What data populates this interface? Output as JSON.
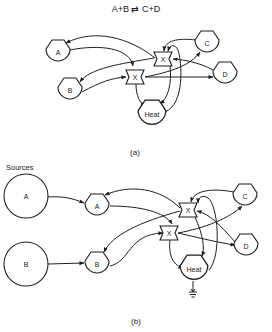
{
  "title": "A+B ⇄ C+D",
  "panels": [
    {
      "id": "a",
      "caption": "(a)",
      "nodes": [
        {
          "id": "a-A",
          "label": "A",
          "shape": "pentagon-bag"
        },
        {
          "id": "a-B",
          "label": "B",
          "shape": "pentagon-bag"
        },
        {
          "id": "a-X1",
          "label": "X",
          "shape": "flag"
        },
        {
          "id": "a-X2",
          "label": "X",
          "shape": "flag"
        },
        {
          "id": "a-C",
          "label": "C",
          "shape": "pentagon-bag"
        },
        {
          "id": "a-D",
          "label": "D",
          "shape": "pentagon-bag"
        },
        {
          "id": "a-Heat",
          "label": "Heat",
          "shape": "pentagon-bag"
        }
      ]
    },
    {
      "id": "b",
      "caption": "(b)",
      "sources_label": "Sources",
      "nodes": [
        {
          "id": "b-srcA",
          "label": "A",
          "shape": "circle"
        },
        {
          "id": "b-srcB",
          "label": "B",
          "shape": "circle"
        },
        {
          "id": "b-A",
          "label": "A",
          "shape": "pentagon-bag"
        },
        {
          "id": "b-B",
          "label": "B",
          "shape": "pentagon-bag"
        },
        {
          "id": "b-X1",
          "label": "X",
          "shape": "flag"
        },
        {
          "id": "b-X2",
          "label": "X",
          "shape": "flag"
        },
        {
          "id": "b-C",
          "label": "C",
          "shape": "pentagon-bag"
        },
        {
          "id": "b-D",
          "label": "D",
          "shape": "pentagon-bag"
        },
        {
          "id": "b-Heat",
          "label": "Heat",
          "shape": "pentagon-bag"
        },
        {
          "id": "b-ground",
          "label": "",
          "shape": "ground-symbol"
        }
      ]
    }
  ],
  "labels": {
    "a_A": "A",
    "a_B": "B",
    "a_X1": "X",
    "a_X2": "X",
    "a_C": "C",
    "a_D": "D",
    "a_Heat": "Heat",
    "b_srcA": "A",
    "b_srcB": "B",
    "b_A": "A",
    "b_B": "B",
    "b_X1": "X",
    "b_X2": "X",
    "b_C": "C",
    "b_D": "D",
    "b_Heat": "Heat",
    "sources": "Sources",
    "cap_a": "(a)",
    "cap_b": "(b)"
  },
  "colors": {
    "ink": "#1f1f1f",
    "background": "#ffffff"
  }
}
